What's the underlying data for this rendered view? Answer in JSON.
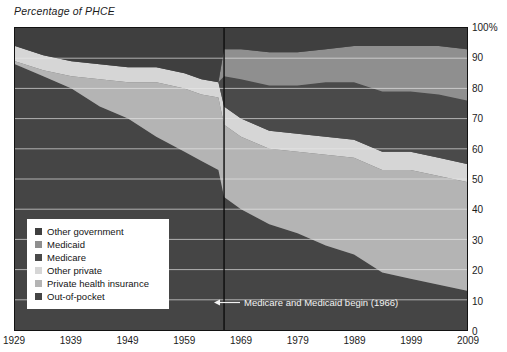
{
  "axis_title": "Percentage of PHCE",
  "legend": {
    "items": [
      {
        "label": "Other government",
        "color": "#3f3f3f"
      },
      {
        "label": "Medicaid",
        "color": "#8f8f8f"
      },
      {
        "label": "Medicare",
        "color": "#4a4a4a"
      },
      {
        "label": "Other private",
        "color": "#d6d6d6"
      },
      {
        "label": "Private health insurance",
        "color": "#b4b4b4"
      },
      {
        "label": "Out-of-pocket",
        "color": "#454545"
      }
    ]
  },
  "annotation": {
    "text": "Medicare and Medicaid begin (1966)",
    "arrow": "left-arrow-icon",
    "year": 1966
  },
  "chart_data": {
    "type": "area",
    "title": "Percentage of PHCE",
    "xlabel": "",
    "ylabel": "Percentage of PHCE",
    "stacked": true,
    "stack_order_bottom_to_top": [
      "Out-of-pocket",
      "Private health insurance",
      "Other private",
      "Medicare",
      "Medicaid",
      "Other government"
    ],
    "grid": true,
    "legend_position": "inside-bottom-left",
    "xlim": [
      1929,
      2009
    ],
    "ylim": [
      0,
      100
    ],
    "ytick_labels": [
      "0",
      "10",
      "20",
      "30",
      "40",
      "50",
      "60",
      "70",
      "80",
      "90",
      "100%"
    ],
    "yticks": [
      0,
      10,
      20,
      30,
      40,
      50,
      60,
      70,
      80,
      90,
      100
    ],
    "xticks": [
      1929,
      1939,
      1949,
      1959,
      1969,
      1979,
      1989,
      1999,
      2009
    ],
    "x": [
      1929,
      1934,
      1939,
      1944,
      1949,
      1954,
      1959,
      1962,
      1965,
      1966,
      1969,
      1974,
      1979,
      1984,
      1989,
      1994,
      1999,
      2004,
      2009
    ],
    "series": [
      {
        "name": "Out-of-pocket",
        "color": "#454545",
        "values": [
          88,
          84,
          80,
          74,
          70,
          64,
          59,
          56,
          53,
          44,
          40,
          35,
          32,
          28,
          25,
          19,
          17,
          15,
          13
        ]
      },
      {
        "name": "Private health insurance",
        "color": "#b4b4b4",
        "values": [
          1,
          2,
          4,
          9,
          12,
          18,
          21,
          22,
          24,
          24,
          24,
          25,
          27,
          30,
          32,
          34,
          36,
          36,
          36
        ]
      },
      {
        "name": "Other private",
        "color": "#d6d6d6",
        "values": [
          5,
          5,
          5,
          5,
          5,
          5,
          5,
          5,
          5,
          6,
          6,
          6,
          6,
          6,
          6,
          6,
          6,
          6,
          6
        ]
      },
      {
        "name": "Medicare",
        "color": "#4a4a4a",
        "values": [
          0,
          0,
          0,
          0,
          0,
          0,
          0,
          0,
          0,
          10,
          13,
          15,
          16,
          18,
          19,
          20,
          20,
          21,
          21
        ]
      },
      {
        "name": "Medicaid",
        "color": "#8f8f8f",
        "values": [
          0,
          0,
          0,
          0,
          0,
          0,
          0,
          0,
          0,
          9,
          10,
          11,
          11,
          11,
          12,
          15,
          15,
          16,
          17
        ]
      },
      {
        "name": "Other government",
        "color": "#3f3f3f",
        "values": [
          6,
          9,
          11,
          12,
          13,
          13,
          15,
          17,
          18,
          7,
          7,
          8,
          8,
          7,
          6,
          6,
          6,
          6,
          7
        ]
      }
    ]
  }
}
